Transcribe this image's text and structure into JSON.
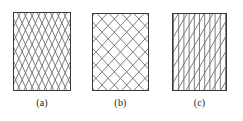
{
  "figure": {
    "background_color": "#ffffff",
    "border_color": "#3a3a3a",
    "hatch_color": "#6e6e6e",
    "caption_color": "#1c1c1c",
    "panels": [
      {
        "id": "a",
        "caption": "(a)",
        "pattern_name": "steep-diamond-cross-hatch",
        "box": {
          "x": 13,
          "y": 12,
          "width": 58,
          "height": 79
        },
        "caption_y": 97,
        "hatch": {
          "type": "cross",
          "directions": [
            "up-right",
            "down-right"
          ],
          "angle_degrees": 65,
          "spacing": 6.0,
          "line_width": 0.9
        }
      },
      {
        "id": "b",
        "caption": "(b)",
        "pattern_name": "open-diamond-cross-hatch",
        "box": {
          "x": 92,
          "y": 13,
          "width": 57,
          "height": 78
        },
        "caption_y": 97,
        "hatch": {
          "type": "cross",
          "directions": [
            "up-right",
            "down-right"
          ],
          "angle_degrees": 47,
          "spacing": 9.0,
          "line_width": 0.9
        }
      },
      {
        "id": "c",
        "caption": "(c)",
        "pattern_name": "vertical-plus-single-diagonal-hatch",
        "box": {
          "x": 172,
          "y": 13,
          "width": 55,
          "height": 78
        },
        "caption_y": 97,
        "hatch": {
          "type": "vertical-and-diagonal",
          "directions": [
            "vertical",
            "up-right"
          ],
          "angle_degrees": 60,
          "spacing": 5.2,
          "diagonal_spacing": 7.5,
          "line_width": 0.9
        }
      }
    ]
  }
}
